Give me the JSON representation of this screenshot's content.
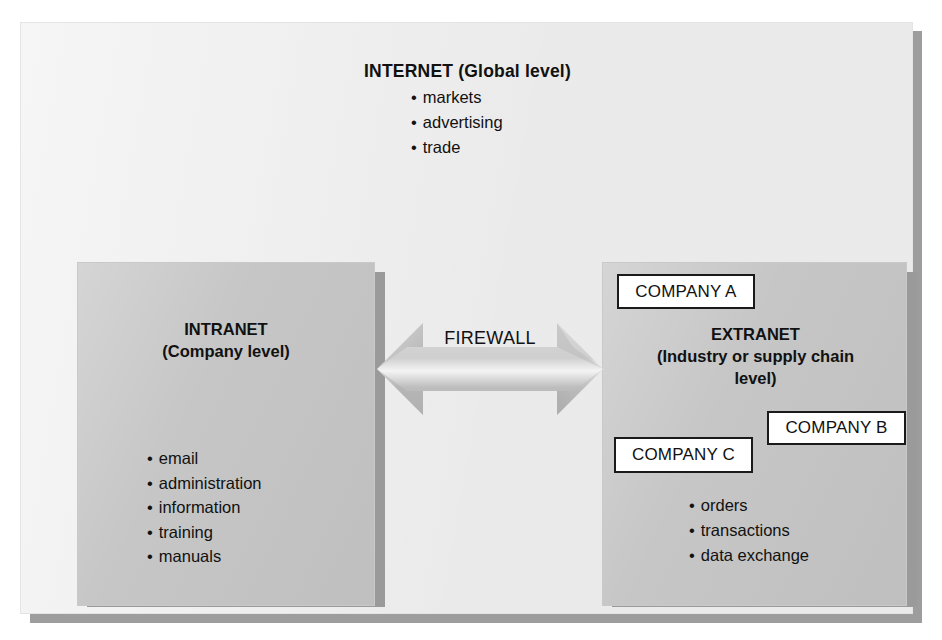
{
  "diagram": {
    "colors": {
      "panel_background": "#efeeee",
      "box_fill": "#c3c3c3",
      "shadow": "#9a9a9a",
      "company_box_fill": "#ffffff",
      "company_box_border": "#1a1a1a",
      "text": "#111111"
    },
    "internet": {
      "title": "INTERNET (Global level)",
      "bullets": [
        "markets",
        "advertising",
        "trade"
      ]
    },
    "intranet": {
      "title_line1": "INTRANET",
      "title_line2": "(Company level)",
      "bullets": [
        "email",
        "administration",
        "information",
        "training",
        "manuals"
      ]
    },
    "extranet": {
      "title_line1": "EXTRANET",
      "title_line2": "(Industry or supply chain",
      "title_line3": "level)",
      "bullets": [
        "orders",
        "transactions",
        "data exchange"
      ],
      "companies": [
        {
          "label": "COMPANY A"
        },
        {
          "label": "COMPANY B"
        },
        {
          "label": "COMPANY C"
        }
      ]
    },
    "connector": {
      "label": "FIREWALL",
      "type": "double-headed-arrow"
    },
    "bullet_glyph": "•"
  }
}
